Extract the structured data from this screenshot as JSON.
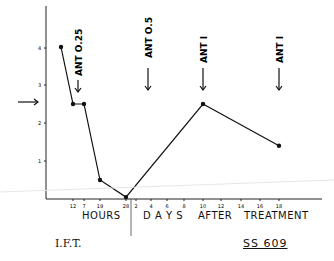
{
  "chart_data": {
    "type": "line",
    "title": "",
    "xlabel_segments": [
      "HOURS",
      "DAYS",
      "AFTER",
      "TREATMENT"
    ],
    "ylabel": "",
    "y_ticks": [
      "1",
      "2",
      "3",
      "4"
    ],
    "ylim": [
      0,
      4.5
    ],
    "x_ticks_hours": [
      "12",
      "7",
      "19",
      "28"
    ],
    "x_ticks_days": [
      "2",
      "4",
      "6",
      "8",
      "10",
      "12",
      "14",
      "16",
      "18"
    ],
    "series": [
      {
        "name": "SS 609",
        "points": [
          {
            "x_label": "start",
            "y": 4.0
          },
          {
            "x_label": "12 h",
            "y": 2.5
          },
          {
            "x_label": "7 h",
            "y": 2.5
          },
          {
            "x_label": "19 h",
            "y": 0.5
          },
          {
            "x_label": "28 h",
            "y": 0.05
          },
          {
            "x_label": "8 days",
            "y": 2.5
          },
          {
            "x_label": "15 days",
            "y": 1.4
          }
        ]
      }
    ],
    "annotations": [
      {
        "text": "ANT O.25",
        "type": "down-arrow",
        "position": "hours ~12"
      },
      {
        "text": "ANT O.5",
        "type": "down-arrow",
        "position": "day ~2"
      },
      {
        "text": "ANT I",
        "type": "down-arrow",
        "position": "day 8"
      },
      {
        "text": "ANT I",
        "type": "down-arrow",
        "position": "day 15"
      },
      {
        "text": "",
        "type": "right-arrow",
        "position": "y ~2.4"
      }
    ],
    "grid": false,
    "legend": "none"
  },
  "labels": {
    "hours": "HOURS",
    "days": "D A Y S",
    "after": "AFTER",
    "treatment": "TREATMENT",
    "ift": "I.F.T.",
    "subject": "SS 609"
  }
}
